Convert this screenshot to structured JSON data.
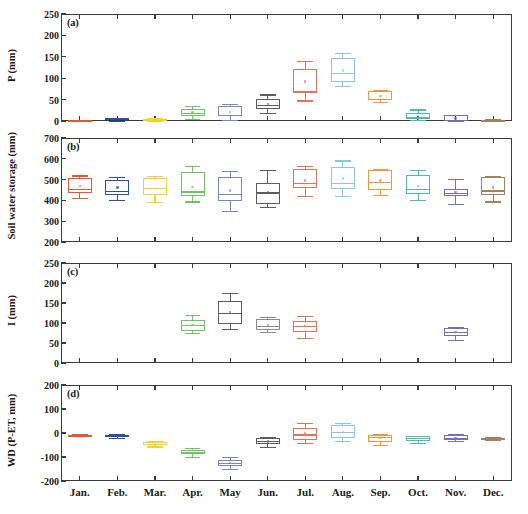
{
  "figure": {
    "width": 528,
    "height": 514,
    "months": [
      "Jan.",
      "Feb.",
      "Mar.",
      "Apr.",
      "May",
      "Jun.",
      "Jul.",
      "Aug.",
      "Sep.",
      "Oct.",
      "Nov.",
      "Dec."
    ],
    "month_colors": [
      "#e8572a",
      "#2a4f9e",
      "#f2d32c",
      "#72c06a",
      "#7a86c4",
      "#5d5d5d",
      "#e8705a",
      "#8fc4dd",
      "#f09441",
      "#52b9ab",
      "#6f6fbd",
      "#a87e5e"
    ]
  },
  "chart_data": [
    {
      "type": "box",
      "panel": "a",
      "title": "(a)",
      "xlabel": "",
      "ylabel": "P (mm)",
      "ylim": [
        0,
        250
      ],
      "yticks": [
        0,
        50,
        100,
        150,
        200,
        250
      ],
      "categories": [
        "Jan.",
        "Feb.",
        "Mar.",
        "Apr.",
        "May",
        "Jun.",
        "Jul.",
        "Aug.",
        "Sep.",
        "Oct.",
        "Nov.",
        "Dec."
      ],
      "boxes": [
        {
          "category": "Jan.",
          "color": "#e8572a",
          "min": 0,
          "q1": 0,
          "median": 1,
          "q3": 2,
          "max": 3,
          "mean": 1
        },
        {
          "category": "Feb.",
          "color": "#2a4f9e",
          "min": 0,
          "q1": 2,
          "median": 4,
          "q3": 6,
          "max": 8,
          "mean": 4
        },
        {
          "category": "Mar.",
          "color": "#f2d32c",
          "min": 0,
          "q1": 1,
          "median": 2,
          "q3": 4,
          "max": 6,
          "mean": 3
        },
        {
          "category": "Apr.",
          "color": "#72c06a",
          "min": 5,
          "q1": 12,
          "median": 18,
          "q3": 27,
          "max": 35,
          "mean": 20
        },
        {
          "category": "May",
          "color": "#7a86c4",
          "min": 3,
          "q1": 12,
          "median": 15,
          "q3": 34,
          "max": 40,
          "mean": 21
        },
        {
          "category": "Jun.",
          "color": "#5d5d5d",
          "min": 18,
          "q1": 28,
          "median": 38,
          "q3": 52,
          "max": 62,
          "mean": 40
        },
        {
          "category": "Jul.",
          "color": "#e8705a",
          "min": 48,
          "q1": 65,
          "median": 70,
          "q3": 122,
          "max": 140,
          "mean": 92
        },
        {
          "category": "Aug.",
          "color": "#8fc4dd",
          "min": 82,
          "q1": 92,
          "median": 112,
          "q3": 148,
          "max": 158,
          "mean": 118
        },
        {
          "category": "Sep.",
          "color": "#f09441",
          "min": 45,
          "q1": 48,
          "median": 52,
          "q3": 70,
          "max": 72,
          "mean": 58
        },
        {
          "category": "Oct.",
          "color": "#52b9ab",
          "min": 2,
          "q1": 5,
          "median": 10,
          "q3": 18,
          "max": 27,
          "mean": 12
        },
        {
          "category": "Nov.",
          "color": "#6f6fbd",
          "min": 0,
          "q1": 1,
          "median": 3,
          "q3": 13,
          "max": 14,
          "mean": 6
        },
        {
          "category": "Dec.",
          "color": "#a87e5e",
          "min": 0,
          "q1": 0,
          "median": 1,
          "q3": 3,
          "max": 4,
          "mean": 2
        }
      ]
    },
    {
      "type": "box",
      "panel": "b",
      "title": "(b)",
      "xlabel": "",
      "ylabel": "Soil water storage  (mm)",
      "ylim": [
        200,
        700
      ],
      "yticks": [
        200,
        300,
        400,
        500,
        600,
        700
      ],
      "categories": [
        "Jan.",
        "Feb.",
        "Mar.",
        "Apr.",
        "May",
        "Jun.",
        "Jul.",
        "Aug.",
        "Sep.",
        "Oct.",
        "Nov.",
        "Dec."
      ],
      "boxes": [
        {
          "category": "Jan.",
          "color": "#e8572a",
          "min": 410,
          "q1": 437,
          "median": 456,
          "q3": 508,
          "max": 520,
          "mean": 468
        },
        {
          "category": "Feb.",
          "color": "#2a4f9e",
          "min": 403,
          "q1": 425,
          "median": 447,
          "q3": 497,
          "max": 512,
          "mean": 462
        },
        {
          "category": "Mar.",
          "color": "#f2d32c",
          "min": 392,
          "q1": 425,
          "median": 462,
          "q3": 510,
          "max": 518,
          "mean": 460
        },
        {
          "category": "Apr.",
          "color": "#72c06a",
          "min": 395,
          "q1": 420,
          "median": 443,
          "q3": 538,
          "max": 565,
          "mean": 464
        },
        {
          "category": "May",
          "color": "#7a86c4",
          "min": 348,
          "q1": 395,
          "median": 430,
          "q3": 514,
          "max": 540,
          "mean": 448
        },
        {
          "category": "Jun.",
          "color": "#5d5d5d",
          "min": 368,
          "q1": 384,
          "median": 438,
          "q3": 482,
          "max": 545,
          "mean": 440
        },
        {
          "category": "Jul.",
          "color": "#e8705a",
          "min": 422,
          "q1": 462,
          "median": 482,
          "q3": 552,
          "max": 566,
          "mean": 496
        },
        {
          "category": "Aug.",
          "color": "#8fc4dd",
          "min": 420,
          "q1": 455,
          "median": 485,
          "q3": 562,
          "max": 592,
          "mean": 505
        },
        {
          "category": "Sep.",
          "color": "#f09441",
          "min": 428,
          "q1": 448,
          "median": 488,
          "q3": 545,
          "max": 550,
          "mean": 495
        },
        {
          "category": "Oct.",
          "color": "#52b9ab",
          "min": 400,
          "q1": 432,
          "median": 455,
          "q3": 520,
          "max": 545,
          "mean": 470
        },
        {
          "category": "Nov.",
          "color": "#6f6fbd",
          "min": 382,
          "q1": 420,
          "median": 437,
          "q3": 455,
          "max": 505,
          "mean": 440
        },
        {
          "category": "Dec.",
          "color": "#a87e5e",
          "min": 395,
          "q1": 428,
          "median": 448,
          "q3": 512,
          "max": 518,
          "mean": 462
        }
      ]
    },
    {
      "type": "box",
      "panel": "c",
      "title": "(c)",
      "xlabel": "",
      "ylabel": "I (mm)",
      "ylim": [
        0,
        250
      ],
      "yticks": [
        0,
        50,
        100,
        150,
        200,
        250
      ],
      "categories": [
        "Jan.",
        "Feb.",
        "Mar.",
        "Apr.",
        "May",
        "Jun.",
        "Jul.",
        "Aug.",
        "Sep.",
        "Oct.",
        "Nov.",
        "Dec."
      ],
      "boxes": [
        {
          "category": "Apr.",
          "color": "#72c06a",
          "min": 75,
          "q1": 80,
          "median": 96,
          "q3": 108,
          "max": 120,
          "mean": 95
        },
        {
          "category": "May",
          "color": "#5d5d5d",
          "min": 85,
          "q1": 97,
          "median": 125,
          "q3": 155,
          "max": 175,
          "mean": 127
        },
        {
          "category": "Jun.",
          "color": "#8a8a8a",
          "min": 78,
          "q1": 82,
          "median": 92,
          "q3": 110,
          "max": 115,
          "mean": 95
        },
        {
          "category": "Jul.",
          "color": "#e8705a",
          "min": 62,
          "q1": 78,
          "median": 92,
          "q3": 105,
          "max": 118,
          "mean": 92
        },
        {
          "category": "Nov.",
          "color": "#6f6fbd",
          "min": 58,
          "q1": 68,
          "median": 78,
          "q3": 88,
          "max": 90,
          "mean": 78
        }
      ]
    },
    {
      "type": "box",
      "panel": "d",
      "title": "(d)",
      "xlabel": "",
      "ylabel": "WD (P-ET, mm)",
      "ylim": [
        -200,
        200
      ],
      "yticks": [
        -200,
        -100,
        0,
        100,
        200
      ],
      "categories": [
        "Jan.",
        "Feb.",
        "Mar.",
        "Apr.",
        "May",
        "Jun.",
        "Jul.",
        "Aug.",
        "Sep.",
        "Oct.",
        "Nov.",
        "Dec."
      ],
      "boxes": [
        {
          "category": "Jan.",
          "color": "#e8572a",
          "min": -14,
          "q1": -12,
          "median": -10,
          "q3": -8,
          "max": -6,
          "mean": -10
        },
        {
          "category": "Feb.",
          "color": "#2a4f9e",
          "min": -20,
          "q1": -16,
          "median": -12,
          "q3": -8,
          "max": -6,
          "mean": -12
        },
        {
          "category": "Mar.",
          "color": "#f2d32c",
          "min": -56,
          "q1": -50,
          "median": -44,
          "q3": -38,
          "max": -34,
          "mean": -45
        },
        {
          "category": "Apr.",
          "color": "#72c06a",
          "min": -98,
          "q1": -88,
          "median": -78,
          "q3": -70,
          "max": -62,
          "mean": -79
        },
        {
          "category": "May",
          "color": "#7a86c4",
          "min": -148,
          "q1": -136,
          "median": -126,
          "q3": -112,
          "max": -98,
          "mean": -125
        },
        {
          "category": "Jun.",
          "color": "#5d5d5d",
          "min": -58,
          "q1": -45,
          "median": -33,
          "q3": -22,
          "max": -18,
          "mean": -35
        },
        {
          "category": "Jul.",
          "color": "#e8705a",
          "min": -40,
          "q1": -28,
          "median": -6,
          "q3": 22,
          "max": 42,
          "mean": -2
        },
        {
          "category": "Aug.",
          "color": "#8fc4dd",
          "min": -32,
          "q1": -20,
          "median": 6,
          "q3": 34,
          "max": 40,
          "mean": 4
        },
        {
          "category": "Sep.",
          "color": "#f09441",
          "min": -48,
          "q1": -38,
          "median": -16,
          "q3": -8,
          "max": -6,
          "mean": -20
        },
        {
          "category": "Oct.",
          "color": "#52b9ab",
          "min": -42,
          "q1": -32,
          "median": -22,
          "q3": -14,
          "max": -12,
          "mean": -24
        },
        {
          "category": "Nov.",
          "color": "#6f6fbd",
          "min": -34,
          "q1": -30,
          "median": -22,
          "q3": -8,
          "max": -6,
          "mean": -20
        },
        {
          "category": "Dec.",
          "color": "#a87e5e",
          "min": -28,
          "q1": -26,
          "median": -22,
          "q3": -20,
          "max": -18,
          "mean": -23
        }
      ]
    }
  ]
}
